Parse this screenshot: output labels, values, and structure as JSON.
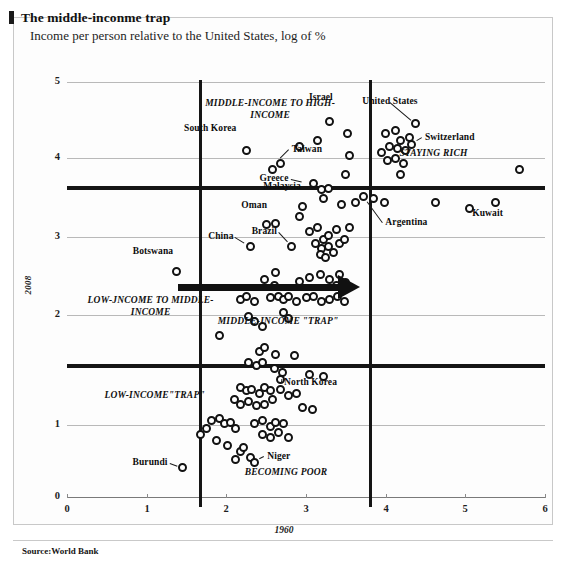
{
  "header": {
    "title": "The middle-inconme trap",
    "subtitle": "Income per person relative to the United States, log of %"
  },
  "source": "Source:World Bank",
  "chart_data": {
    "type": "scatter",
    "title": "The middle-inconme trap",
    "subtitle": "Income per person relative to the United States, log of %",
    "xlabel": "1960",
    "ylabel": "2008",
    "xlim": [
      0,
      6
    ],
    "ylim": [
      0,
      5
    ],
    "xticks": [
      "0",
      "1",
      "2",
      "3",
      "4",
      "5",
      "6"
    ],
    "yticks": [
      "0",
      "1",
      "2",
      "3",
      "4",
      "5"
    ],
    "grid": true,
    "legend": "none",
    "dividers": {
      "vertical_x": [
        1.65,
        3.78
      ],
      "horizontal_y": [
        3.9,
        1.62
      ]
    },
    "annotations": [
      {
        "text": "MIDDLE-INCOME TO HIGH-INCOME",
        "x": 2.55,
        "y": 4.72
      },
      {
        "text": "STAYING RICH",
        "x": 4.6,
        "y": 4.12
      },
      {
        "text": "LOW-JNCOME TO MIDDLE-INCOME",
        "x": 1.05,
        "y": 2.35
      },
      {
        "text": "MIDDLE-INCOME \"TRAP\"",
        "x": 2.65,
        "y": 2.1
      },
      {
        "text": "LOW-INCOME\"TRAP\"",
        "x": 1.1,
        "y": 1.2
      },
      {
        "text": "BECOMING POOR",
        "x": 2.75,
        "y": 0.28
      }
    ],
    "labeled_points": [
      {
        "name": "United States",
        "x": 4.38,
        "y": 4.5
      },
      {
        "name": "Switzerland",
        "x": 4.33,
        "y": 4.25
      },
      {
        "name": "Israel",
        "x": 3.3,
        "y": 4.52
      },
      {
        "name": "South Korea",
        "x": 2.25,
        "y": 4.18
      },
      {
        "name": "Taiwan",
        "x": 2.62,
        "y": 4.02
      },
      {
        "name": "Greece",
        "x": 3.02,
        "y": 3.78
      },
      {
        "name": "Kuwait",
        "x": 5.38,
        "y": 3.55
      },
      {
        "name": "Malaysia",
        "x": 2.95,
        "y": 3.5
      },
      {
        "name": "Argentina",
        "x": 3.72,
        "y": 3.62
      },
      {
        "name": "Oman",
        "x": 2.5,
        "y": 3.28
      },
      {
        "name": "China",
        "x": 2.3,
        "y": 3.02
      },
      {
        "name": "Brazil",
        "x": 2.82,
        "y": 3.02
      },
      {
        "name": "Botswana",
        "x": 1.38,
        "y": 2.72
      },
      {
        "name": "North Korea",
        "x": 2.7,
        "y": 1.5
      },
      {
        "name": "Niger",
        "x": 2.35,
        "y": 0.42
      },
      {
        "name": "Burundi",
        "x": 1.45,
        "y": 0.35
      }
    ],
    "points": [
      [
        2.25,
        4.18
      ],
      [
        2.58,
        3.95
      ],
      [
        2.68,
        4.02
      ],
      [
        2.92,
        4.22
      ],
      [
        3.3,
        4.52
      ],
      [
        3.15,
        4.3
      ],
      [
        3.52,
        4.38
      ],
      [
        3.55,
        4.12
      ],
      [
        3.5,
        3.88
      ],
      [
        3.1,
        3.78
      ],
      [
        3.2,
        3.7
      ],
      [
        3.28,
        3.72
      ],
      [
        3.22,
        3.6
      ],
      [
        2.95,
        3.5
      ],
      [
        3.45,
        3.52
      ],
      [
        3.62,
        3.55
      ],
      [
        3.72,
        3.62
      ],
      [
        3.85,
        3.6
      ],
      [
        3.98,
        3.55
      ],
      [
        4.38,
        4.5
      ],
      [
        4.33,
        4.25
      ],
      [
        4.0,
        4.38
      ],
      [
        4.12,
        4.42
      ],
      [
        4.18,
        4.3
      ],
      [
        4.3,
        4.33
      ],
      [
        4.05,
        4.22
      ],
      [
        4.15,
        4.2
      ],
      [
        4.25,
        4.18
      ],
      [
        3.95,
        4.15
      ],
      [
        4.02,
        4.05
      ],
      [
        4.12,
        4.08
      ],
      [
        4.22,
        4.02
      ],
      [
        4.18,
        3.88
      ],
      [
        4.62,
        3.55
      ],
      [
        5.38,
        3.55
      ],
      [
        5.68,
        3.95
      ],
      [
        5.05,
        3.48
      ],
      [
        2.5,
        3.28
      ],
      [
        2.62,
        3.3
      ],
      [
        2.3,
        3.02
      ],
      [
        2.82,
        3.02
      ],
      [
        2.92,
        3.38
      ],
      [
        3.05,
        3.2
      ],
      [
        3.15,
        3.25
      ],
      [
        3.22,
        3.1
      ],
      [
        3.28,
        3.15
      ],
      [
        3.38,
        3.22
      ],
      [
        3.12,
        3.05
      ],
      [
        3.2,
        3.0
      ],
      [
        3.28,
        3.02
      ],
      [
        3.18,
        2.92
      ],
      [
        3.25,
        2.88
      ],
      [
        3.42,
        3.05
      ],
      [
        3.48,
        3.1
      ],
      [
        3.55,
        3.25
      ],
      [
        3.35,
        2.95
      ],
      [
        1.38,
        2.72
      ],
      [
        2.48,
        2.62
      ],
      [
        2.62,
        2.7
      ],
      [
        2.6,
        2.55
      ],
      [
        2.92,
        2.6
      ],
      [
        3.05,
        2.65
      ],
      [
        3.18,
        2.68
      ],
      [
        3.3,
        2.62
      ],
      [
        3.42,
        2.68
      ],
      [
        3.38,
        2.55
      ],
      [
        3.5,
        2.58
      ],
      [
        2.18,
        2.38
      ],
      [
        2.25,
        2.42
      ],
      [
        2.35,
        2.35
      ],
      [
        2.55,
        2.4
      ],
      [
        2.65,
        2.42
      ],
      [
        2.72,
        2.38
      ],
      [
        2.78,
        2.42
      ],
      [
        2.88,
        2.35
      ],
      [
        3.0,
        2.4
      ],
      [
        3.1,
        2.42
      ],
      [
        3.2,
        2.35
      ],
      [
        3.3,
        2.38
      ],
      [
        3.4,
        2.42
      ],
      [
        3.48,
        2.35
      ],
      [
        2.28,
        2.18
      ],
      [
        2.35,
        2.12
      ],
      [
        2.45,
        2.05
      ],
      [
        2.72,
        2.22
      ],
      [
        2.78,
        2.15
      ],
      [
        1.92,
        1.95
      ],
      [
        2.42,
        1.75
      ],
      [
        2.48,
        1.8
      ],
      [
        2.62,
        1.72
      ],
      [
        2.85,
        1.7
      ],
      [
        2.28,
        1.62
      ],
      [
        2.38,
        1.58
      ],
      [
        2.45,
        1.62
      ],
      [
        2.6,
        1.55
      ],
      [
        2.7,
        1.5
      ],
      [
        2.68,
        1.42
      ],
      [
        3.05,
        1.48
      ],
      [
        3.22,
        1.45
      ],
      [
        2.18,
        1.32
      ],
      [
        2.25,
        1.28
      ],
      [
        2.32,
        1.3
      ],
      [
        2.42,
        1.25
      ],
      [
        2.48,
        1.32
      ],
      [
        2.55,
        1.28
      ],
      [
        2.68,
        1.3
      ],
      [
        2.78,
        1.22
      ],
      [
        2.88,
        1.25
      ],
      [
        2.1,
        1.18
      ],
      [
        2.18,
        1.12
      ],
      [
        2.28,
        1.15
      ],
      [
        2.38,
        1.1
      ],
      [
        2.48,
        1.12
      ],
      [
        2.58,
        1.18
      ],
      [
        2.95,
        1.08
      ],
      [
        3.08,
        1.05
      ],
      [
        1.82,
        0.92
      ],
      [
        1.92,
        0.95
      ],
      [
        1.98,
        0.88
      ],
      [
        2.05,
        0.9
      ],
      [
        2.12,
        0.82
      ],
      [
        1.75,
        0.82
      ],
      [
        1.68,
        0.75
      ],
      [
        2.35,
        0.88
      ],
      [
        2.45,
        0.92
      ],
      [
        2.55,
        0.85
      ],
      [
        2.62,
        0.9
      ],
      [
        2.72,
        0.88
      ],
      [
        2.45,
        0.75
      ],
      [
        2.55,
        0.72
      ],
      [
        2.65,
        0.78
      ],
      [
        2.78,
        0.72
      ],
      [
        1.88,
        0.68
      ],
      [
        2.02,
        0.62
      ],
      [
        2.18,
        0.55
      ],
      [
        2.22,
        0.6
      ],
      [
        2.3,
        0.48
      ],
      [
        2.35,
        0.42
      ],
      [
        1.45,
        0.35
      ],
      [
        2.12,
        0.45
      ]
    ]
  }
}
